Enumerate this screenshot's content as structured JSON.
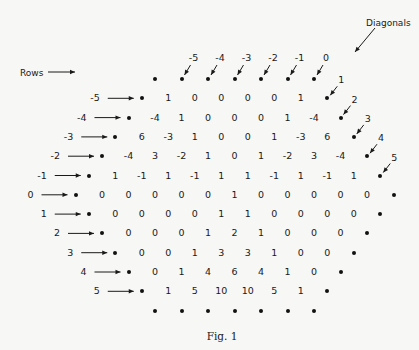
{
  "labels": {
    "rows_title": "Rows",
    "diagonals_title": "Diagonals",
    "caption": "Fig. 1"
  },
  "colors": {
    "ink": "#1a1a1a",
    "paper": "#f7f7f5"
  },
  "grid": {
    "top_dot_count": 7,
    "bottom_dot_count": 7,
    "rows": [
      {
        "label": "-5",
        "values": [
          "1",
          "0",
          "0",
          "0",
          "0",
          "1"
        ]
      },
      {
        "label": "-4",
        "values": [
          "-4",
          "1",
          "0",
          "0",
          "0",
          "1",
          "-4"
        ]
      },
      {
        "label": "-3",
        "values": [
          "6",
          "-3",
          "1",
          "0",
          "0",
          "1",
          "-3",
          "6"
        ]
      },
      {
        "label": "-2",
        "values": [
          "-4",
          "3",
          "-2",
          "1",
          "0",
          "1",
          "-2",
          "3",
          "-4"
        ]
      },
      {
        "label": "-1",
        "values": [
          "1",
          "-1",
          "1",
          "-1",
          "1",
          "1",
          "-1",
          "1",
          "-1",
          "1"
        ]
      },
      {
        "label": "0",
        "values": [
          "0",
          "0",
          "0",
          "0",
          "0",
          "1",
          "0",
          "0",
          "0",
          "0",
          "0"
        ]
      },
      {
        "label": "1",
        "values": [
          "0",
          "0",
          "0",
          "0",
          "1",
          "1",
          "0",
          "0",
          "0",
          "0"
        ]
      },
      {
        "label": "2",
        "values": [
          "0",
          "0",
          "0",
          "1",
          "2",
          "1",
          "0",
          "0",
          "0"
        ]
      },
      {
        "label": "3",
        "values": [
          "0",
          "0",
          "1",
          "3",
          "3",
          "1",
          "0",
          "0"
        ]
      },
      {
        "label": "4",
        "values": [
          "0",
          "1",
          "4",
          "6",
          "4",
          "1",
          "0"
        ]
      },
      {
        "label": "5",
        "values": [
          "1",
          "5",
          "10",
          "10",
          "5",
          "1"
        ]
      }
    ],
    "diagonals_top": [
      "-5",
      "-4",
      "-3",
      "-2",
      "-1",
      "0"
    ],
    "diagonals_right": [
      "1",
      "2",
      "3",
      "4",
      "5"
    ]
  }
}
